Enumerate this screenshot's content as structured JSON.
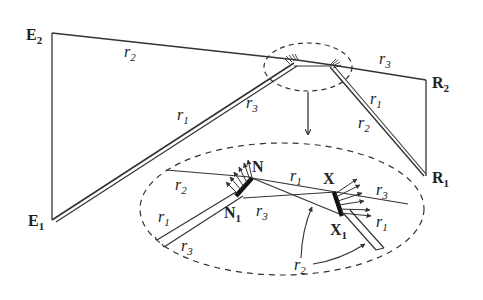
{
  "diagram": {
    "nodes": {
      "E2": {
        "label": "E",
        "sub": "2"
      },
      "E1": {
        "label": "E",
        "sub": "1"
      },
      "R2": {
        "label": "R",
        "sub": "2"
      },
      "R1": {
        "label": "R",
        "sub": "1"
      },
      "N": {
        "label": "N"
      },
      "N1": {
        "label": "N",
        "sub": "1"
      },
      "X": {
        "label": "X"
      },
      "X1": {
        "label": "X",
        "sub": "1"
      }
    },
    "main_labels": {
      "r2_top": {
        "label": "r",
        "sub": "2"
      },
      "r1_left": {
        "label": "r",
        "sub": "1"
      },
      "r3_left": {
        "label": "r",
        "sub": "3"
      },
      "r3_right": {
        "label": "r",
        "sub": "3"
      },
      "r1_right": {
        "label": "r",
        "sub": "1"
      },
      "r2_right": {
        "label": "r",
        "sub": "2"
      }
    },
    "inset_labels": {
      "r2_top_left": {
        "label": "r",
        "sub": "2"
      },
      "r1_left": {
        "label": "r",
        "sub": "1"
      },
      "r3_bottom_left": {
        "label": "r",
        "sub": "3"
      },
      "r3_mid": {
        "label": "r",
        "sub": "3"
      },
      "r1_mid": {
        "label": "r",
        "sub": "1"
      },
      "r3_right": {
        "label": "r",
        "sub": "3"
      },
      "r1_right": {
        "label": "r",
        "sub": "1"
      },
      "r2_bottom": {
        "label": "r",
        "sub": "2"
      }
    },
    "colors": {
      "line": "#333333",
      "text": "#222222",
      "background": "#ffffff"
    }
  }
}
